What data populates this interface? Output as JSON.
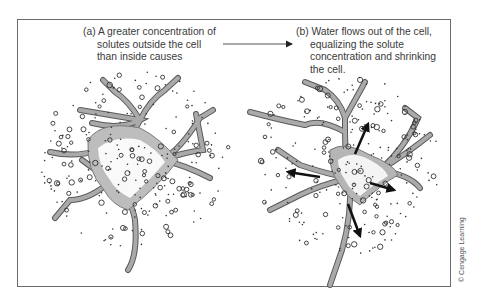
{
  "panels": {
    "a": {
      "caption_lines": [
        "(a) A greater concentration of",
        "solutes outside the cell",
        "than inside causes"
      ]
    },
    "b": {
      "caption_lines": [
        "(b) Water flows out of the cell,",
        "equalizing the solute",
        "concentration and shrinking",
        "the cell."
      ]
    }
  },
  "connector_arrow": {
    "direction": "right",
    "from_panel": "a",
    "to_panel": "b"
  },
  "credit": "© Cengage Learning",
  "colors": {
    "frame": "#6b6b6b",
    "cell_fill": "#a9a9a9",
    "cell_stroke": "#5a5a5a",
    "cytoplasm_shade": "#c4c4c4",
    "solute": "#333333",
    "text": "#3a3a3a",
    "water_arrow": "#111111"
  },
  "icons": {
    "water-flow-arrows": "4 bold black arrows pointing outward from cell in panel b"
  }
}
